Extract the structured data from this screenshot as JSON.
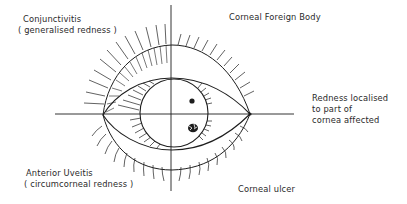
{
  "diagram": {
    "type": "annotated eye diagram (quadrants)",
    "labels": {
      "top_left": {
        "title": "Conjunctivitis",
        "subtitle": "( generalised redness )"
      },
      "top_right": {
        "title": "Corneal Foreign Body"
      },
      "right": {
        "line1": "Redness localised",
        "line2": "to part of",
        "line3": "cornea affected"
      },
      "bottom_left": {
        "title": "Anterior Uveitis",
        "subtitle": "( circumcorneal redness )"
      },
      "bottom_right": {
        "title": "Corneal ulcer"
      }
    },
    "colors": {
      "ink": "#1e1e1e",
      "background": "#ffffff"
    }
  }
}
